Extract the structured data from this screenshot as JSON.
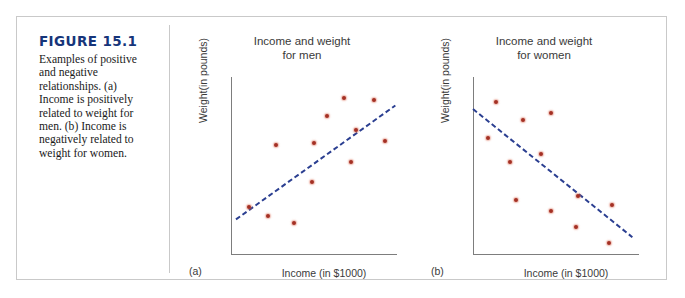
{
  "figure": {
    "number": "FIGURE 15.1",
    "caption": "Examples of positive and negative relationships. (a) Income is positively related to weight for men. (b) Income is negatively related to weight for women.",
    "heading_color": "#16357a",
    "frame_color": "#c9c9c9"
  },
  "style": {
    "dot_color": "#a33024",
    "trend_line_color": "#2b3f91",
    "axis_color": "#7d7d7d",
    "text_color": "#3a3a3a"
  },
  "chart_data": [
    {
      "type": "scatter",
      "panel": "(a)",
      "title_line1": "Income and weight",
      "title_line2": "for men",
      "xlabel": "Income (in $1000)",
      "ylabel": "Weight(in pounds)",
      "relationship": "positive",
      "grid": false,
      "xlim": [
        0,
        100
      ],
      "ylim": [
        0,
        100
      ],
      "points": [
        {
          "x": 11,
          "y": 27
        },
        {
          "x": 22,
          "y": 22
        },
        {
          "x": 27,
          "y": 62
        },
        {
          "x": 38,
          "y": 18
        },
        {
          "x": 50,
          "y": 63
        },
        {
          "x": 49,
          "y": 41
        },
        {
          "x": 58,
          "y": 78
        },
        {
          "x": 68,
          "y": 88
        },
        {
          "x": 72,
          "y": 52
        },
        {
          "x": 75,
          "y": 70
        },
        {
          "x": 86,
          "y": 87
        },
        {
          "x": 93,
          "y": 64
        }
      ],
      "trend_line": {
        "x1": 3,
        "y1": 20,
        "x2": 99,
        "y2": 84
      }
    },
    {
      "type": "scatter",
      "panel": "(b)",
      "title_line1": "Income and weight",
      "title_line2": "for women",
      "xlabel": "Income (in $1000)",
      "ylabel": "Weight(in pounds)",
      "relationship": "negative",
      "grid": false,
      "xlim": [
        0,
        100
      ],
      "ylim": [
        0,
        100
      ],
      "points": [
        {
          "x": 14,
          "y": 86
        },
        {
          "x": 9,
          "y": 66
        },
        {
          "x": 30,
          "y": 76
        },
        {
          "x": 47,
          "y": 80
        },
        {
          "x": 22,
          "y": 52
        },
        {
          "x": 41,
          "y": 57
        },
        {
          "x": 26,
          "y": 31
        },
        {
          "x": 47,
          "y": 25
        },
        {
          "x": 63,
          "y": 33
        },
        {
          "x": 62,
          "y": 16
        },
        {
          "x": 84,
          "y": 28
        },
        {
          "x": 82,
          "y": 7
        }
      ],
      "trend_line": {
        "x1": 0,
        "y1": 82,
        "x2": 96,
        "y2": 10
      }
    }
  ]
}
